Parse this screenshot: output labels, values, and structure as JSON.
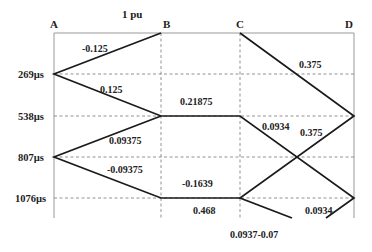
{
  "diagram": {
    "type": "bewley-lattice",
    "source_label": "1 pu",
    "nodes": [
      {
        "id": "A",
        "label": "A"
      },
      {
        "id": "B",
        "label": "B"
      },
      {
        "id": "C",
        "label": "C"
      },
      {
        "id": "D",
        "label": "D"
      }
    ],
    "time_marks": [
      "269µs",
      "538µs",
      "807µs",
      "1076µs"
    ],
    "wave_labels": {
      "a_b_top": "-0.125",
      "a_b_269": "0.125",
      "c_d_top": "0.375",
      "b_c_538": "0.21875",
      "c_d_538": "0.0934",
      "d_cross": "0.375",
      "a_b_807_up": "0.09375",
      "a_b_807_down": "-0.09375",
      "b_c_1076_above": "-0.1639",
      "b_c_1076_below": "0.468",
      "c_out": "0.0937-0.07",
      "d_out": "0.0934"
    }
  }
}
